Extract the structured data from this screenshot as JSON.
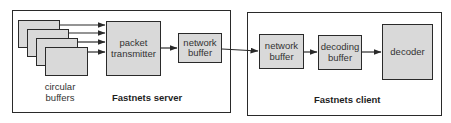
{
  "server": {
    "title": "Fastnets server",
    "circular_buffers_label_line1": "circular",
    "circular_buffers_label_line2": "buffers",
    "circular_buffer_count": 4,
    "packet_transmitter_line1": "packet",
    "packet_transmitter_line2": "transmitter",
    "network_buffer_line1": "network",
    "network_buffer_line2": "buffer"
  },
  "client": {
    "title": "Fastnets client",
    "network_buffer_line1": "network",
    "network_buffer_line2": "buffer",
    "decoding_buffer_line1": "decoding",
    "decoding_buffer_line2": "buffer",
    "decoder": "decoder"
  },
  "colors": {
    "box_fill": "#d9d9d9",
    "stroke": "#2a2a2a",
    "text": "#333333"
  }
}
